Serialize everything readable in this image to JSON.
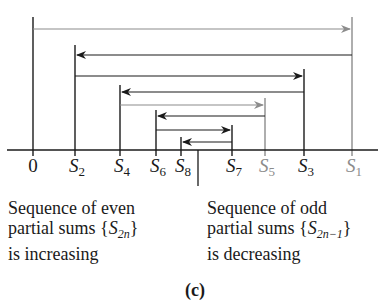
{
  "diagram": {
    "type": "number-line-alternating-series",
    "axis": {
      "y": 150,
      "x_start": 7,
      "x_end": 378
    },
    "limit_marker": {
      "x": 198,
      "y_top": 150,
      "y_bottom": 186
    },
    "colors": {
      "black": "#1a1a1a",
      "gray": "#8c8c8c"
    },
    "ticks": [
      {
        "id": "0",
        "label": "0",
        "sub": "",
        "x": 33,
        "top": 17,
        "color": "black"
      },
      {
        "id": "S2",
        "label": "S",
        "sub": "2",
        "x": 75,
        "top": 45,
        "color": "black"
      },
      {
        "id": "S4",
        "label": "S",
        "sub": "4",
        "x": 120,
        "top": 85,
        "color": "black"
      },
      {
        "id": "S6",
        "label": "S",
        "sub": "6",
        "x": 156,
        "top": 110,
        "color": "black"
      },
      {
        "id": "S8",
        "label": "S",
        "sub": "8",
        "x": 181,
        "top": 137,
        "color": "black"
      },
      {
        "id": "S7",
        "label": "S",
        "sub": "7",
        "x": 232,
        "top": 125,
        "color": "black"
      },
      {
        "id": "S5",
        "label": "S",
        "sub": "5",
        "x": 265,
        "top": 98,
        "color": "gray"
      },
      {
        "id": "S3",
        "label": "S",
        "sub": "3",
        "x": 304,
        "top": 69,
        "color": "black"
      },
      {
        "id": "S1",
        "label": "S",
        "sub": "1",
        "x": 352,
        "top": 17,
        "color": "gray"
      }
    ],
    "arrows": [
      {
        "from": "0",
        "to": "S1",
        "y": 29,
        "color": "gray"
      },
      {
        "from": "S1",
        "to": "S2",
        "y": 55,
        "color": "black"
      },
      {
        "from": "S2",
        "to": "S3",
        "y": 76,
        "color": "black"
      },
      {
        "from": "S3",
        "to": "S4",
        "y": 92,
        "color": "black"
      },
      {
        "from": "S4",
        "to": "S5",
        "y": 105,
        "color": "gray"
      },
      {
        "from": "S5",
        "to": "S6",
        "y": 116,
        "color": "black"
      },
      {
        "from": "S6",
        "to": "S7",
        "y": 130,
        "color": "black"
      },
      {
        "from": "S7",
        "to": "S8",
        "y": 142,
        "color": "black"
      }
    ]
  },
  "captions": {
    "left": {
      "line1": "Sequence of even",
      "line2_prefix": "partial sums {",
      "line2_var": "S",
      "line2_sub": "2n",
      "line2_suffix": "}",
      "line3": "is increasing"
    },
    "right": {
      "line1": "Sequence of odd",
      "line2_prefix": "partial sums {",
      "line2_var": "S",
      "line2_sub": "2n−1",
      "line2_suffix": "}",
      "line3": "is decreasing"
    }
  },
  "figure_label": "(c)"
}
